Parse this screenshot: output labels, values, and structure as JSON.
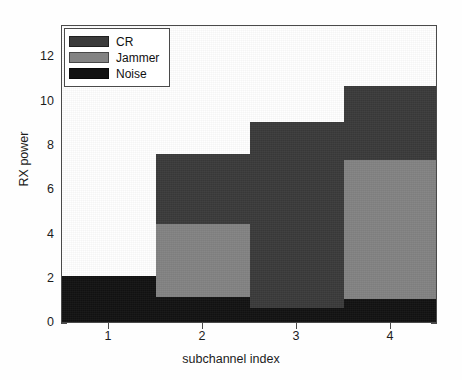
{
  "chart_data": {
    "type": "bar",
    "subtype": "stacked-vertical",
    "title": "",
    "xlabel": "subchannel index",
    "ylabel": "RX power",
    "categories": [
      "1",
      "2",
      "3",
      "4"
    ],
    "x": [
      1,
      2,
      3,
      4
    ],
    "xlim": [
      0.5,
      4.5
    ],
    "ylim": [
      0,
      13
    ],
    "yticks": [
      0,
      2,
      4,
      6,
      8,
      10,
      12
    ],
    "xticks": [
      1,
      2,
      3,
      4
    ],
    "grid": false,
    "legend_position": "upper-left",
    "stack_order_bottom_to_top": [
      "Noise",
      "Jammer",
      "CR"
    ],
    "series": [
      {
        "name": "Noise",
        "color": "#121212",
        "values": [
          2.0,
          1.1,
          0.6,
          1.0
        ]
      },
      {
        "name": "Jammer",
        "color": "#838383",
        "values": [
          0.0,
          3.2,
          0.0,
          6.1
        ]
      },
      {
        "name": "CR",
        "color": "#3b3b3b",
        "values": [
          0.0,
          3.1,
          8.2,
          3.25
        ]
      }
    ],
    "cumulative_tops": {
      "Noise": [
        2.0,
        1.1,
        0.6,
        1.0
      ],
      "Jammer": [
        2.0,
        4.3,
        0.6,
        7.1
      ],
      "CR": [
        2.0,
        7.4,
        8.8,
        10.35
      ]
    },
    "totals": [
      2.0,
      7.4,
      8.8,
      10.35
    ]
  },
  "legend": {
    "entries": [
      {
        "label": "CR",
        "color": "#3b3b3b"
      },
      {
        "label": "Jammer",
        "color": "#838383"
      },
      {
        "label": "Noise",
        "color": "#121212"
      }
    ]
  },
  "axes": {
    "y_tick_labels": [
      "0",
      "2",
      "4",
      "6",
      "8",
      "10",
      "12"
    ],
    "x_tick_labels": [
      "1",
      "2",
      "3",
      "4"
    ],
    "x_axis_title": "subchannel index",
    "y_axis_title": "RX power"
  },
  "colors": {
    "cr": "#3b3b3b",
    "jammer": "#838383",
    "noise": "#121212",
    "axis": "#4a4a4a",
    "background": "#ffffff"
  }
}
